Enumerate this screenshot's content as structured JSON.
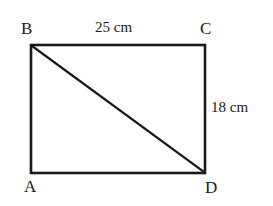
{
  "figure": {
    "type": "rectangle-with-diagonal",
    "background_color": "#ffffff",
    "stroke_color": "#1a1a1a",
    "vertices": {
      "top_left": "B",
      "top_right": "C",
      "bottom_left": "A",
      "bottom_right": "D"
    },
    "labels": {
      "vertex_b": "B",
      "vertex_c": "C",
      "vertex_a": "A",
      "vertex_d": "D",
      "top_side": "25 cm",
      "right_side": "18 cm"
    },
    "geometry": {
      "rect_left": 31,
      "rect_top": 45,
      "rect_right": 205,
      "rect_bottom": 173,
      "diagonal_from": "B",
      "diagonal_to": "D"
    }
  }
}
